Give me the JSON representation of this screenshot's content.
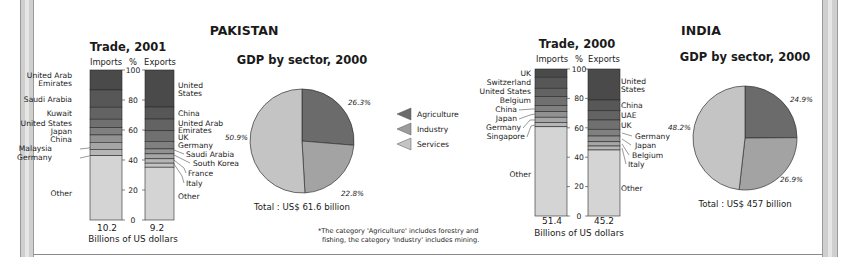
{
  "chart_data": [
    {
      "type": "bar",
      "subtype": "100% stacked bar",
      "country": "PAKISTAN",
      "title": "Trade, 2001",
      "xlabel": "Billions of US dollars",
      "ylabel": "%",
      "ylim": [
        0,
        100
      ],
      "yticks": [
        0,
        20,
        40,
        60,
        80,
        100
      ],
      "categories": [
        "Imports",
        "Exports"
      ],
      "totals": [
        "10.2",
        "9.2"
      ],
      "series": {
        "Imports": [
          {
            "name": "United Arab Emirates",
            "value": 13.3
          },
          {
            "name": "Saudi Arabia",
            "value": 11.5
          },
          {
            "name": "Kuwait",
            "value": 8.0
          },
          {
            "name": "United States",
            "value": 5.6
          },
          {
            "name": "Japan",
            "value": 4.9
          },
          {
            "name": "China",
            "value": 4.9
          },
          {
            "name": "Malaysia",
            "value": 4.7
          },
          {
            "name": "Germany",
            "value": 4.2
          },
          {
            "name": "Other",
            "value": 42.9
          }
        ],
        "Exports": [
          {
            "name": "United States",
            "value": 24.7
          },
          {
            "name": "China",
            "value": 8.0
          },
          {
            "name": "United Arab Emirates",
            "value": 7.8
          },
          {
            "name": "UK",
            "value": 7.1
          },
          {
            "name": "Germany",
            "value": 5.0
          },
          {
            "name": "Saudi Arabia",
            "value": 3.3
          },
          {
            "name": "South Korea",
            "value": 3.3
          },
          {
            "name": "France",
            "value": 2.9
          },
          {
            "name": "Italy",
            "value": 2.7
          },
          {
            "name": "Other",
            "value": 35.2
          }
        ]
      }
    },
    {
      "type": "pie",
      "country": "PAKISTAN",
      "title": "GDP by sector, 2000",
      "categories": [
        "Agriculture",
        "Industry",
        "Services"
      ],
      "values": [
        26.3,
        22.8,
        50.9
      ],
      "labels": [
        "26.3%",
        "22.8%",
        "50.9%"
      ],
      "total": "Total : US$ 61.6 billion"
    },
    {
      "type": "bar",
      "subtype": "100% stacked bar",
      "country": "INDIA",
      "title": "Trade, 2000",
      "xlabel": "Billions of US dollars",
      "ylabel": "%",
      "ylim": [
        0,
        100
      ],
      "yticks": [
        0,
        20,
        40,
        60,
        80,
        100
      ],
      "categories": [
        "Imports",
        "Exports"
      ],
      "totals": [
        "51.4",
        "45.2"
      ],
      "series": {
        "Imports": [
          {
            "name": "UK",
            "value": 5.6
          },
          {
            "name": "Switzerland",
            "value": 7.5
          },
          {
            "name": "United States",
            "value": 5.7
          },
          {
            "name": "Belgium",
            "value": 6.1
          },
          {
            "name": "China",
            "value": 4.1
          },
          {
            "name": "Japan",
            "value": 3.8
          },
          {
            "name": "Germany",
            "value": 3.6
          },
          {
            "name": "Singapore",
            "value": 2.9
          },
          {
            "name": "Other",
            "value": 60.7
          }
        ],
        "Exports": [
          {
            "name": "United States",
            "value": 21.1
          },
          {
            "name": "China",
            "value": 7.3
          },
          {
            "name": "UAE",
            "value": 6.3
          },
          {
            "name": "UK",
            "value": 6.3
          },
          {
            "name": "Germany",
            "value": 4.6
          },
          {
            "name": "Japan",
            "value": 3.9
          },
          {
            "name": "Belgium",
            "value": 2.9
          },
          {
            "name": "Italy",
            "value": 2.7
          },
          {
            "name": "Other",
            "value": 44.9
          }
        ]
      }
    },
    {
      "type": "pie",
      "country": "INDIA",
      "title": "GDP by sector, 2000",
      "categories": [
        "Agriculture",
        "Industry",
        "Services"
      ],
      "values": [
        24.9,
        26.9,
        48.2
      ],
      "labels": [
        "24.9%",
        "26.9%",
        "48.2%"
      ],
      "total": "Total : US$ 457 billion"
    }
  ],
  "pakistan": {
    "country": "PAKISTAN",
    "trade_title": "Trade, 2001",
    "imports_label": "Imports",
    "pct_label": "%",
    "exports_label": "Exports",
    "imports_total": "10.2",
    "exports_total": "9.2",
    "unit": "Billions of US dollars",
    "import_labels": [
      {
        "text": "United Arab",
        "x": 72,
        "y": 78
      },
      {
        "text": "Emirates",
        "x": 72,
        "y": 86
      },
      {
        "text": "Saudi Arabia",
        "x": 72,
        "y": 102
      },
      {
        "text": "Kuwait",
        "x": 72,
        "y": 116
      },
      {
        "text": "United States",
        "x": 72,
        "y": 126
      },
      {
        "text": "Japan",
        "x": 72,
        "y": 134
      },
      {
        "text": "China",
        "x": 72,
        "y": 142
      },
      {
        "text": "Malaysia",
        "x": 52,
        "y": 151
      },
      {
        "text": "Germany",
        "x": 52,
        "y": 160
      },
      {
        "text": "Other",
        "x": 72,
        "y": 196
      }
    ],
    "export_labels": [
      {
        "text": "United",
        "x": 178,
        "y": 88
      },
      {
        "text": "States",
        "x": 178,
        "y": 96
      },
      {
        "text": "China",
        "x": 178,
        "y": 116
      },
      {
        "text": "United Arab",
        "x": 178,
        "y": 126
      },
      {
        "text": "Emirates",
        "x": 178,
        "y": 133
      },
      {
        "text": "UK",
        "x": 178,
        "y": 140
      },
      {
        "text": "Germany",
        "x": 178,
        "y": 148
      },
      {
        "text": "Saudi Arabia",
        "x": 186,
        "y": 157
      },
      {
        "text": "South Korea",
        "x": 193,
        "y": 166
      },
      {
        "text": "France",
        "x": 188,
        "y": 176
      },
      {
        "text": "Italy",
        "x": 186,
        "y": 186
      },
      {
        "text": "Other",
        "x": 178,
        "y": 199
      }
    ],
    "gdp_title": "GDP by sector, 2000",
    "pct_agri": "26.3%",
    "pct_ind": "22.8%",
    "pct_serv": "50.9%",
    "gdp_total": "Total : US$ 61.6 billion"
  },
  "india": {
    "country": "INDIA",
    "trade_title": "Trade, 2000",
    "imports_label": "Imports",
    "pct_label": "%",
    "exports_label": "Exports",
    "imports_total": "51.4",
    "exports_total": "45.2",
    "unit": "Billions of US dollars",
    "import_labels": [
      {
        "text": "UK",
        "x": 531,
        "y": 76
      },
      {
        "text": "Switzerland",
        "x": 531,
        "y": 85
      },
      {
        "text": "United States",
        "x": 531,
        "y": 94
      },
      {
        "text": "Belgium",
        "x": 531,
        "y": 103
      },
      {
        "text": "China",
        "x": 517,
        "y": 112
      },
      {
        "text": "Japan",
        "x": 517,
        "y": 121
      },
      {
        "text": "Germany",
        "x": 521,
        "y": 130
      },
      {
        "text": "Singapore",
        "x": 525,
        "y": 139
      },
      {
        "text": "Other",
        "x": 531,
        "y": 177
      }
    ],
    "export_labels": [
      {
        "text": "United",
        "x": 621,
        "y": 84
      },
      {
        "text": "States",
        "x": 621,
        "y": 92
      },
      {
        "text": "China",
        "x": 621,
        "y": 108
      },
      {
        "text": "UAE",
        "x": 621,
        "y": 118
      },
      {
        "text": "UK",
        "x": 621,
        "y": 128
      },
      {
        "text": "Germany",
        "x": 635,
        "y": 139
      },
      {
        "text": "Japan",
        "x": 635,
        "y": 148
      },
      {
        "text": "Belgium",
        "x": 632,
        "y": 158
      },
      {
        "text": "Italy",
        "x": 628,
        "y": 167
      },
      {
        "text": "Other",
        "x": 621,
        "y": 191
      }
    ],
    "gdp_title": "GDP by sector, 2000",
    "pct_agri": "24.9%",
    "pct_ind": "26.9%",
    "pct_serv": "48.2%",
    "gdp_total": "Total : US$ 457 billion"
  },
  "legend": {
    "items": [
      {
        "label": "Agriculture",
        "color": "#6b6b6b"
      },
      {
        "label": "Industry",
        "color": "#9c9c9c"
      },
      {
        "label": "Services",
        "color": "#c4c4c4"
      }
    ]
  },
  "footnote": {
    "line1": "*The category 'Agriculture' includes forestry and",
    "line2": "fishing, the category 'Industry' includes mining."
  },
  "colors": {
    "bar_shades": [
      "#4a4a4a",
      "#575757",
      "#636363",
      "#707070",
      "#808080",
      "#929292",
      "#a6a6a6",
      "#b6b6b6",
      "#c3c3c3",
      "#cacaca"
    ],
    "other": "#d4d4d4",
    "pie_agri": "#6b6b6b",
    "pie_ind": "#a3a3a3",
    "pie_serv": "#c4c4c4"
  }
}
